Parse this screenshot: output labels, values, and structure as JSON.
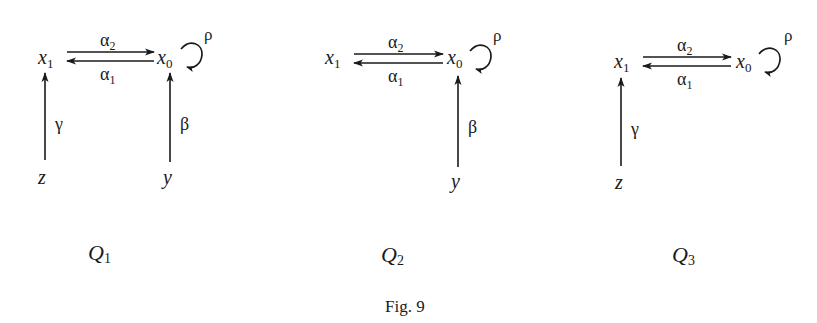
{
  "figure": {
    "caption": "Fig. 9",
    "quivers": [
      {
        "name": "Q",
        "subscript": "1",
        "vertices": [
          {
            "id": "x1",
            "base": "x",
            "sub": "1"
          },
          {
            "id": "x0",
            "base": "x",
            "sub": "0"
          },
          {
            "id": "z",
            "base": "z",
            "sub": ""
          },
          {
            "id": "y",
            "base": "y",
            "sub": ""
          }
        ],
        "arrows": [
          {
            "label": "α",
            "sub": "2",
            "from": "x1",
            "to": "x0"
          },
          {
            "label": "α",
            "sub": "1",
            "from": "x0",
            "to": "x1"
          },
          {
            "label": "ρ",
            "sub": "",
            "from": "x0",
            "to": "x0"
          },
          {
            "label": "γ",
            "sub": "",
            "from": "z",
            "to": "x1"
          },
          {
            "label": "β",
            "sub": "",
            "from": "y",
            "to": "x0"
          }
        ]
      },
      {
        "name": "Q",
        "subscript": "2",
        "vertices": [
          {
            "id": "x1",
            "base": "x",
            "sub": "1"
          },
          {
            "id": "x0",
            "base": "x",
            "sub": "0"
          },
          {
            "id": "y",
            "base": "y",
            "sub": ""
          }
        ],
        "arrows": [
          {
            "label": "α",
            "sub": "2",
            "from": "x1",
            "to": "x0"
          },
          {
            "label": "α",
            "sub": "1",
            "from": "x0",
            "to": "x1"
          },
          {
            "label": "ρ",
            "sub": "",
            "from": "x0",
            "to": "x0"
          },
          {
            "label": "β",
            "sub": "",
            "from": "y",
            "to": "x0"
          }
        ]
      },
      {
        "name": "Q",
        "subscript": "3",
        "vertices": [
          {
            "id": "x1",
            "base": "x",
            "sub": "1"
          },
          {
            "id": "x0",
            "base": "x",
            "sub": "0"
          },
          {
            "id": "z",
            "base": "z",
            "sub": ""
          }
        ],
        "arrows": [
          {
            "label": "α",
            "sub": "2",
            "from": "x1",
            "to": "x0"
          },
          {
            "label": "α",
            "sub": "1",
            "from": "x0",
            "to": "x1"
          },
          {
            "label": "ρ",
            "sub": "",
            "from": "x0",
            "to": "x0"
          },
          {
            "label": "γ",
            "sub": "",
            "from": "z",
            "to": "x1"
          }
        ]
      }
    ]
  }
}
